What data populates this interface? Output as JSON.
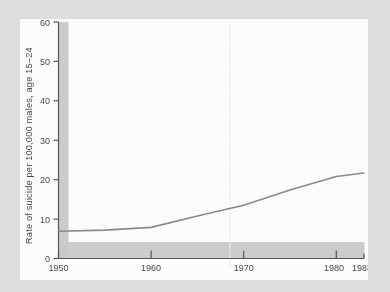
{
  "figure": {
    "background_color": "#dedede",
    "card_color": "#fdfdfd",
    "axis_color": "#575757",
    "line_color": "#8a8a8a",
    "tick_label_color": "#4a4a4a",
    "scan_band_color": "#c9c9c9"
  },
  "chart_data": {
    "type": "line",
    "title": "",
    "xlabel": "",
    "ylabel": "Rate of suicide per 100,000 males, age 15–24",
    "xlim": [
      1950,
      1983
    ],
    "ylim": [
      0,
      60
    ],
    "grid": false,
    "legend": "none",
    "xticks": [
      1950,
      1960,
      1970,
      1980,
      1983
    ],
    "xtick_labels": [
      "1950",
      "1960",
      "1970",
      "1980",
      "1983"
    ],
    "yticks": [
      0,
      10,
      20,
      30,
      40,
      50,
      60
    ],
    "ytick_labels": [
      "0",
      "10",
      "20",
      "30",
      "40",
      "50",
      "60"
    ],
    "series": [
      {
        "name": "Rate of suicide per 100,000 males, age 15–24",
        "x": [
          1950,
          1955,
          1960,
          1965,
          1970,
          1975,
          1980,
          1983
        ],
        "values": [
          6.9,
          7.2,
          7.9,
          10.8,
          13.5,
          17.4,
          20.8,
          21.7
        ]
      }
    ],
    "annotations": []
  },
  "axis": {
    "y_label": "Rate of suicide per 100,000 males, age 15–24",
    "y_ticks": [
      {
        "value": 60,
        "label": "60"
      },
      {
        "value": 50,
        "label": "50"
      },
      {
        "value": 40,
        "label": "40"
      },
      {
        "value": 30,
        "label": "30"
      },
      {
        "value": 20,
        "label": "20"
      },
      {
        "value": 10,
        "label": "10"
      },
      {
        "value": 0,
        "label": "0"
      }
    ],
    "x_ticks": [
      {
        "value": 1950,
        "label": "1950"
      },
      {
        "value": 1960,
        "label": "1960"
      },
      {
        "value": 1970,
        "label": "1970"
      },
      {
        "value": 1980,
        "label": "1980"
      },
      {
        "value": 1983,
        "label": "1983"
      }
    ]
  }
}
